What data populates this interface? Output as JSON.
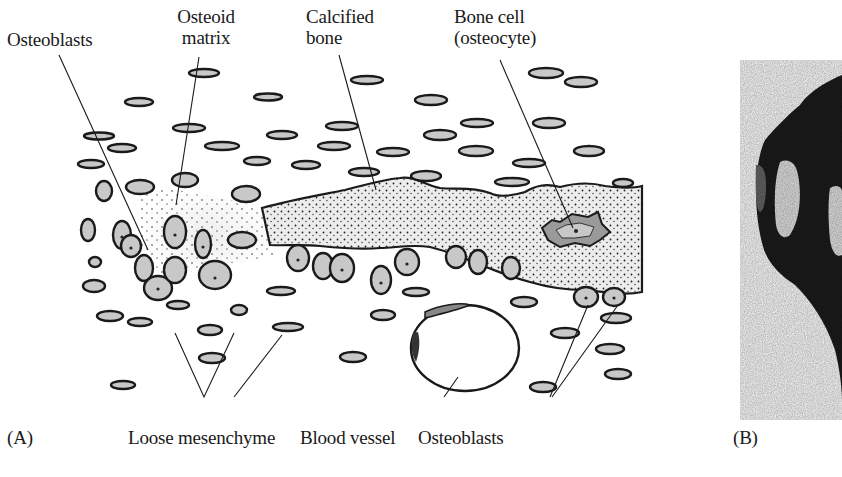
{
  "figure": {
    "panels": [
      {
        "id": "A",
        "label": "(A)"
      },
      {
        "id": "B",
        "label": "(B)"
      }
    ],
    "panel_a": {
      "top_labels": [
        {
          "lines": [
            "Osteoblasts"
          ]
        },
        {
          "lines": [
            "Osteoid",
            "matrix"
          ]
        },
        {
          "lines": [
            "Calcified",
            "bone"
          ]
        },
        {
          "lines": [
            "Bone cell",
            "(osteocyte)"
          ]
        }
      ],
      "bottom_labels": [
        {
          "text": "Loose mesenchyme"
        },
        {
          "text": "Blood vessel"
        },
        {
          "text": "Osteoblasts"
        }
      ]
    },
    "panel_b": {
      "description": "Dark photographic micrograph of a developing bone structure (partially cropped at right edge)"
    },
    "colors": {
      "ink": "#1a1a1a",
      "cell_fill": "#c8c8c8",
      "bone_fill": "#ececec",
      "background": "#ffffff"
    }
  }
}
